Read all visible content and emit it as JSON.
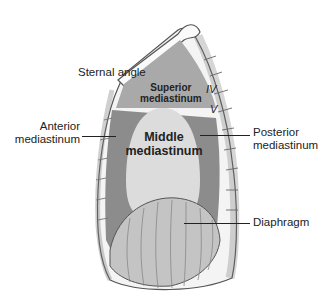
{
  "diagram": {
    "type": "anatomical-illustration",
    "labels": {
      "sternal_angle": "Sternal angle",
      "superior_line1": "Superior",
      "superior_line2": "mediastinum",
      "anterior_line1": "Anterior",
      "anterior_line2": "mediastinum",
      "middle_line1": "Middle",
      "middle_line2": "mediastinum",
      "posterior_line1": "Posterior",
      "posterior_line2": "mediastinum",
      "diaphragm": "Diaphragm",
      "vertebra_iv": "IV",
      "vertebra_v": "V"
    },
    "colors": {
      "superior": "#a9a9a9",
      "anterior_posterior": "#8c8c8c",
      "middle": "#dcdcdc",
      "diaphragm": "#c4c4c4",
      "outline": "#555555"
    }
  }
}
